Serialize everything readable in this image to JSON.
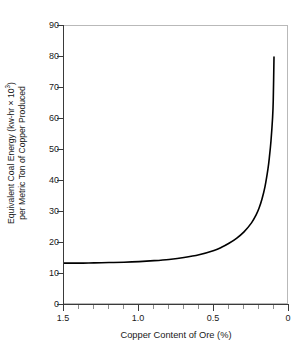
{
  "chart_data": {
    "type": "line",
    "title": "",
    "xlabel": "Copper Content of Ore (%)",
    "ylabel_line1": "Equivalent Coal Energy (kw-hr × 10",
    "ylabel_line1_sup": "3",
    "ylabel_line1_tail": ")",
    "ylabel_line2": "per Metric Ton of Copper Produced",
    "ylabel_full": "Equivalent Coal Energy (kw-hr × 10^3) per Metric Ton of Copper Produced",
    "xlim": [
      1.5,
      0.0
    ],
    "ylim": [
      0,
      90
    ],
    "x_axis_reversed": true,
    "grid": false,
    "legend": null,
    "y_ticks": [
      0,
      10,
      20,
      30,
      40,
      50,
      60,
      70,
      80,
      90
    ],
    "y_tick_labels": [
      "0",
      "10",
      "20",
      "30",
      "40",
      "50",
      "60",
      "70",
      "80",
      "90"
    ],
    "x_ticks_major": [
      1.5,
      1.0,
      0.5,
      0.0
    ],
    "x_tick_labels": [
      "1.5",
      "1.0",
      "0.5",
      "0"
    ],
    "x_ticks_minor": [
      1.4,
      1.3,
      1.2,
      1.1,
      0.9,
      0.8,
      0.7,
      0.6,
      0.4,
      0.3,
      0.2,
      0.1
    ],
    "series_name": "Equivalent coal energy vs copper ore grade",
    "x": [
      1.5,
      1.4,
      1.3,
      1.2,
      1.1,
      1.0,
      0.9,
      0.8,
      0.7,
      0.6,
      0.5,
      0.45,
      0.4,
      0.35,
      0.3,
      0.25,
      0.22,
      0.2,
      0.18,
      0.16,
      0.14,
      0.13,
      0.12,
      0.11,
      0.105,
      0.1
    ],
    "values": [
      13.5,
      13.5,
      13.6,
      13.7,
      13.8,
      14.0,
      14.3,
      14.7,
      15.3,
      16.2,
      17.6,
      18.6,
      19.9,
      21.5,
      23.6,
      26.5,
      29.0,
      31.2,
      34.2,
      38.2,
      44.0,
      48.0,
      53.0,
      60.0,
      66.0,
      80.0
    ],
    "line_color": "#000000",
    "line_width": 1.6,
    "frame_color": "#b9b9b9",
    "axis_color": "#3a3a3a",
    "background": "#ffffff"
  }
}
